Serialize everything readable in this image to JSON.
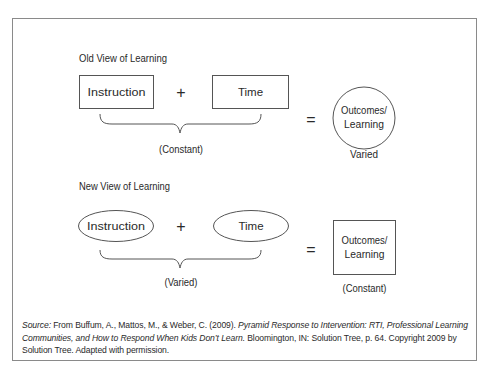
{
  "old_view": {
    "heading": "Old View of Learning",
    "term1": "Instruction",
    "term2": "Time",
    "plus": "+",
    "equals": "=",
    "result_line1": "Outcomes/",
    "result_line2": "Learning",
    "inputs_label": "(Constant)",
    "result_label": "Varied",
    "input_shape": "rectangle",
    "result_shape": "circle"
  },
  "new_view": {
    "heading": "New View of Learning",
    "term1": "Instruction",
    "term2": "Time",
    "plus": "+",
    "equals": "=",
    "result_line1": "Outcomes/",
    "result_line2": "Learning",
    "inputs_label": "(Varied)",
    "result_label": "(Constant)",
    "input_shape": "ellipse",
    "result_shape": "rectangle"
  },
  "source": {
    "label": "Source:",
    "authors": " From Buffum, A., Mattos, M., & Weber, C. (2009). ",
    "title": "Pyramid Response to Intervention: RTI, Professional Learning Communities, and How to Respond When Kids Don’t Learn.",
    "rest": " Bloomington, IN: Solution Tree, p. 64. Copyright 2009 by Solution Tree. Adapted with permission."
  },
  "colors": {
    "stroke": "#555555",
    "text": "#2a2a2a",
    "frame": "#8a8a8a"
  }
}
